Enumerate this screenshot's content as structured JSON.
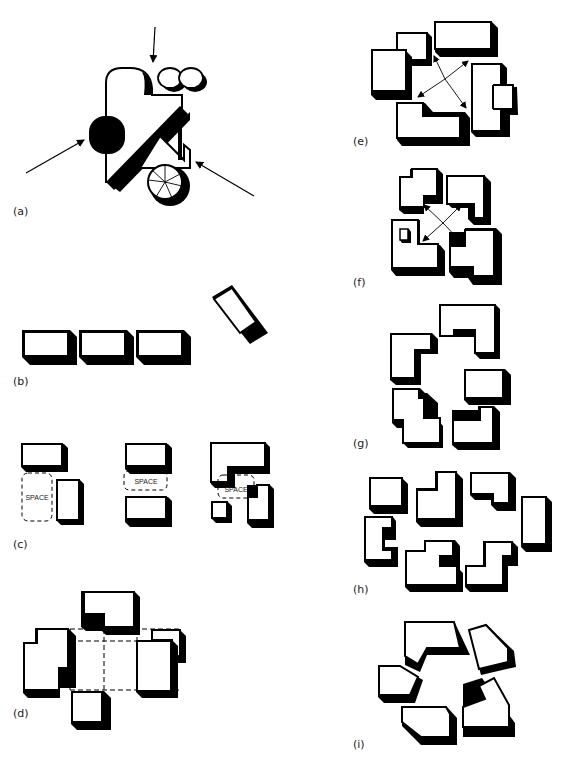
{
  "figure": {
    "panels": [
      {
        "id": "a",
        "label": "(a)"
      },
      {
        "id": "b",
        "label": "(b)"
      },
      {
        "id": "c",
        "label": "(c)",
        "space_labels": [
          "SPACE",
          "SPACE",
          "SPACE"
        ]
      },
      {
        "id": "d",
        "label": "(d)"
      },
      {
        "id": "e",
        "label": "(e)"
      },
      {
        "id": "f",
        "label": "(f)"
      },
      {
        "id": "g",
        "label": "(g)"
      },
      {
        "id": "h",
        "label": "(h)"
      },
      {
        "id": "i",
        "label": "(i)"
      }
    ]
  },
  "colors": {
    "ink": "#000000",
    "paper": "#ffffff",
    "label": "#222222"
  }
}
